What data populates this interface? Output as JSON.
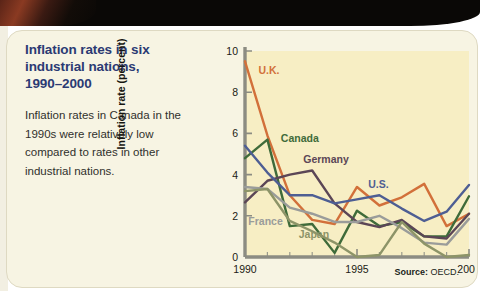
{
  "card": {
    "title": "Inflation rates in six\nindustrial nations,\n1990–2000",
    "caption": "Inflation rates in Canada in the 1990s were relatively low compared to rates in other industrial nations.",
    "source_prefix": "Source:",
    "source_value": "OECD.",
    "background_color": "#f7f4e3",
    "plot_background_color": "#f7eec4",
    "title_color": "#2b3a73"
  },
  "chart_data": {
    "type": "line",
    "title": "Inflation rates in six industrial nations, 1990–2000",
    "xlabel": "",
    "ylabel": "Inflation rate (percent)",
    "xlim": [
      1990,
      2000
    ],
    "ylim": [
      0,
      10
    ],
    "ytick_values": [
      0,
      2,
      4,
      6,
      8,
      10
    ],
    "ytick_labels": [
      "0",
      "2",
      "4",
      "6",
      "8",
      "10"
    ],
    "xtick_values": [
      1990,
      1995,
      2000
    ],
    "xtick_labels": [
      "1990",
      "1995",
      "2000"
    ],
    "x_minor_ticks": [
      1991,
      1992,
      1993,
      1994,
      1996,
      1997,
      1998,
      1999
    ],
    "grid": false,
    "legend": "inline-labels",
    "x": [
      1990,
      1991,
      1992,
      1993,
      1994,
      1995,
      1996,
      1997,
      1998,
      1999,
      2000
    ],
    "series": [
      {
        "name": "U.K.",
        "color": "#d2703a",
        "label_x": 1990.6,
        "label_y": 8.9,
        "values": [
          9.5,
          5.9,
          3.0,
          1.8,
          1.6,
          3.4,
          2.5,
          2.9,
          3.55,
          1.5,
          2.1
        ]
      },
      {
        "name": "Canada",
        "color": "#3f6b3a",
        "label_x": 1991.6,
        "label_y": 5.6,
        "values": [
          4.8,
          5.7,
          1.5,
          1.6,
          0.2,
          2.25,
          1.5,
          1.7,
          1.0,
          1.0,
          2.95
        ]
      },
      {
        "name": "Germany",
        "color": "#5b4656",
        "label_x": 1992.6,
        "label_y": 4.55,
        "values": [
          2.65,
          3.7,
          4.0,
          4.2,
          2.6,
          1.7,
          1.45,
          1.8,
          1.0,
          0.9,
          2.1
        ]
      },
      {
        "name": "U.S.",
        "color": "#4e5e93",
        "label_x": 1995.5,
        "label_y": 3.35,
        "values": [
          5.4,
          4.1,
          3.0,
          3.0,
          2.6,
          2.8,
          3.0,
          2.35,
          1.75,
          2.2,
          3.5
        ]
      },
      {
        "name": "France",
        "color": "#9a9c9a",
        "label_x": 1990.15,
        "label_y": 1.55,
        "values": [
          3.4,
          3.3,
          2.4,
          2.1,
          1.7,
          1.7,
          2.0,
          1.4,
          0.7,
          0.6,
          1.85
        ]
      },
      {
        "name": "Japan",
        "color": "#8d9468",
        "label_x": 1992.4,
        "label_y": 0.9,
        "values": [
          3.2,
          3.3,
          1.75,
          1.25,
          0.7,
          0.0,
          0.1,
          1.7,
          0.65,
          0.0,
          0.1
        ]
      }
    ]
  }
}
